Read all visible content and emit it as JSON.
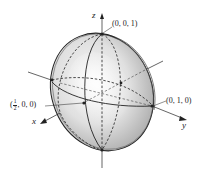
{
  "figure": {
    "type": "ellipsoid-3d-diagram",
    "axes": {
      "x": {
        "label": "x"
      },
      "y": {
        "label": "y"
      },
      "z": {
        "label": "z"
      }
    },
    "points": [
      {
        "id": "top",
        "label": "(0, 0, 1)"
      },
      {
        "id": "side",
        "label": "(0, 1, 0)"
      },
      {
        "id": "front",
        "label_prefix": "(",
        "frac_num": "1",
        "frac_den": "2",
        "label_suffix": ", 0, 0)"
      }
    ],
    "colors": {
      "surface_light": "#f2f2f2",
      "surface_mid": "#d9d9d9",
      "surface_dark": "#a8a8a8",
      "stroke": "#222222"
    }
  }
}
